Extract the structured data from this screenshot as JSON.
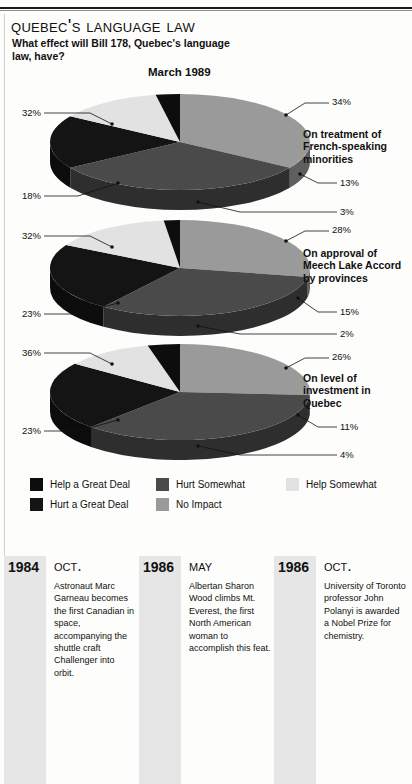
{
  "header": {
    "title": "Quebec's Language Law",
    "subtitle": "What effect will Bill 178, Quebec's language law, have?",
    "chart_date": "March 1989"
  },
  "legend": {
    "items": [
      {
        "label": "Help a Great Deal",
        "color": "#0d0d0d"
      },
      {
        "label": "Hurt a Great Deal",
        "color": "#141414"
      },
      {
        "label": "Hurt Somewhat",
        "color": "#4a4a4a"
      },
      {
        "label": "No Impact",
        "color": "#9a9a9a"
      },
      {
        "label": "Help Somewhat",
        "color": "#e2e2e2"
      }
    ]
  },
  "chart_data": {
    "type": "pie",
    "title": "Quebec's Language Law",
    "subtitle": "What effect will Bill 178, Quebec's language law, have?",
    "date": "March 1989",
    "legend_position": "bottom",
    "categories": [
      "No Impact",
      "Hurt Somewhat",
      "Hurt a Great Deal",
      "Help Somewhat",
      "Help a Great Deal"
    ],
    "colors": [
      "#9a9a9a",
      "#4a4a4a",
      "#141414",
      "#e2e2e2",
      "#0d0d0d"
    ],
    "charts": [
      {
        "name": "On treatment of French-speaking minorities",
        "values": [
          34,
          32,
          18,
          13,
          3
        ],
        "labels": [
          "34%",
          "32%",
          "18%",
          "13%",
          "3%"
        ]
      },
      {
        "name": "On approval of Meech Lake Accord by provinces",
        "values": [
          28,
          32,
          23,
          15,
          2
        ],
        "labels": [
          "28%",
          "32%",
          "23%",
          "15%",
          "2%"
        ]
      },
      {
        "name": "On level of investment in Quebec",
        "values": [
          26,
          36,
          23,
          11,
          4
        ],
        "labels": [
          "26%",
          "36%",
          "23%",
          "11%",
          "4%"
        ]
      }
    ]
  },
  "pies": [
    {
      "category": "On treatment of French-speaking minorities",
      "pct_topright": "34%",
      "pct_left": "32%",
      "pct_bottomleft": "18%",
      "pct_right": "13%",
      "pct_bottom": "3%"
    },
    {
      "category": "On approval of Meech Lake Accord by provinces",
      "pct_topright": "28%",
      "pct_left": "32%",
      "pct_bottomleft": "23%",
      "pct_right": "15%",
      "pct_bottom": "2%"
    },
    {
      "category": "On level of investment in Quebec",
      "pct_topright": "26%",
      "pct_left": "36%",
      "pct_bottomleft": "23%",
      "pct_right": "11%",
      "pct_bottom": "4%"
    }
  ],
  "timeline": [
    {
      "year": "1984",
      "month": "Oct.",
      "text": "Astronaut Marc Garneau becomes the first Canadian in space, accompanying the shuttle craft Challenger into orbit."
    },
    {
      "year": "1986",
      "month": "May",
      "text": "Albertan Sharon Wood climbs Mt. Everest, the first North American woman to accomplish this feat."
    },
    {
      "year": "1986",
      "month": "Oct.",
      "text": "University of Toronto professor John Polanyi is awarded a Nobel Prize for chemistry."
    }
  ]
}
